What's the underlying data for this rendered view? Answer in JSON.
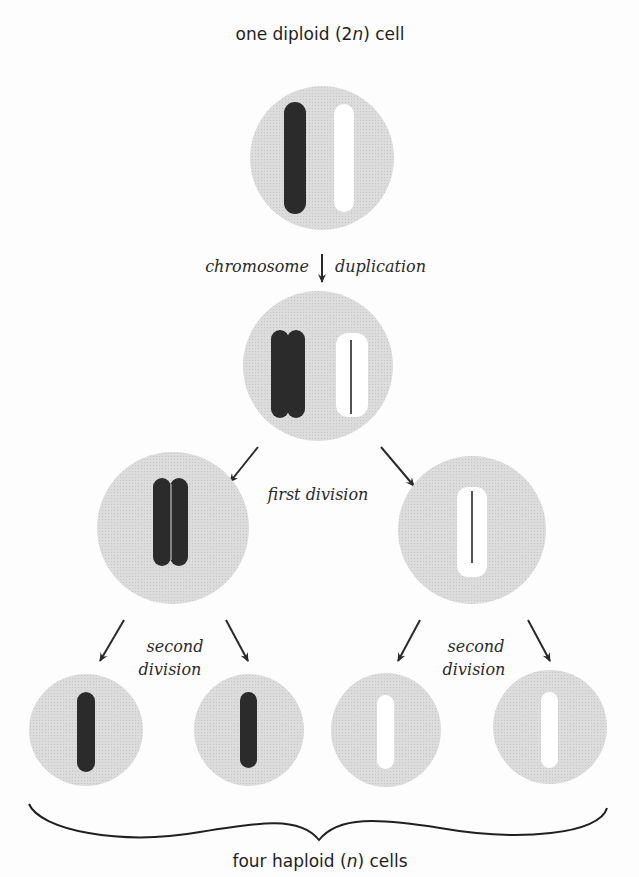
{
  "title": "one diploid (2n) cell",
  "title_parts": {
    "pre": "one diploid (2",
    "italic": "n",
    "post": ") cell"
  },
  "labels": {
    "duplication_left": "chromosome",
    "duplication_right": "duplication",
    "first_division": "first division",
    "second_division_left_line1": "second",
    "second_division_left_line2": "division",
    "second_division_right_line1": "second",
    "second_division_right_line2": "division"
  },
  "footer": "four haploid (n) cells",
  "footer_parts": {
    "pre": "four haploid (",
    "italic": "n",
    "post": ") cells"
  },
  "stages": [
    {
      "name": "diploid-cell",
      "ploidy": "2n",
      "chromosomes": [
        "dark",
        "light"
      ]
    },
    {
      "name": "duplicated-cell",
      "chromosomes": [
        "dark-double",
        "light-double"
      ]
    },
    {
      "name": "first-division-products",
      "cells": [
        "dark-double",
        "light-double"
      ]
    },
    {
      "name": "haploid-cells",
      "ploidy": "n",
      "count": 4,
      "cells": [
        "dark",
        "dark",
        "light",
        "light"
      ]
    }
  ],
  "colors": {
    "cell_fill": "#d9d9d9",
    "dark_chromosome": "#2b2b2b",
    "light_chromosome": "#ffffff",
    "arrow": "#2a2a2a",
    "text": "#1f1f1f"
  }
}
